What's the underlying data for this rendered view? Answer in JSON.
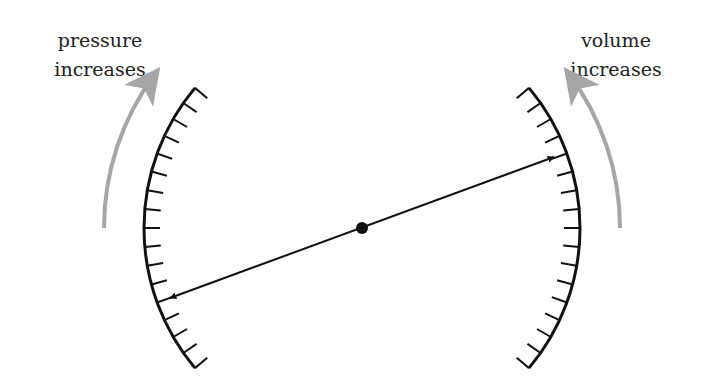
{
  "labels": {
    "left": {
      "line1": "pressure",
      "line2": "increases"
    },
    "right": {
      "line1": "volume",
      "line2": "increases"
    }
  },
  "colors": {
    "ink": "#111111",
    "gray_arrow": "#a6a6a6",
    "background": "#ffffff"
  },
  "geometry": {
    "pivot": {
      "x": 362,
      "y": 228,
      "r": 6
    },
    "scale_radius": 218,
    "scale_start_deg": 40,
    "scale_end_deg": -40,
    "tick_count": 17,
    "tick_length": 16,
    "gray_radius": 258,
    "pointer_left_tip": {
      "x": 170,
      "y": 298
    },
    "pointer_right_tip": {
      "x": 554,
      "y": 157
    }
  }
}
